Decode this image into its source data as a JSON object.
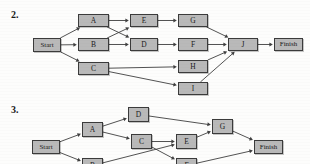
{
  "page": {
    "background_color": "#fdfdfc",
    "width": 310,
    "height": 164
  },
  "problems": [
    {
      "number_label": "2.",
      "number_pos": {
        "x": 11,
        "y": 9
      }
    },
    {
      "number_label": "3.",
      "number_pos": {
        "x": 11,
        "y": 104
      }
    }
  ],
  "style": {
    "node_fill": "#b9b9b9",
    "node_border": "#3b3b3b",
    "edge_color": "#3f3f3f",
    "text_color": "#1b1b1b"
  },
  "diagram_2": {
    "title_label": "2.",
    "nodes": [
      {
        "id": "start",
        "label": "Start",
        "x": 33,
        "y": 38,
        "w": 28,
        "h": 14,
        "terminal": true
      },
      {
        "id": "a",
        "label": "A",
        "x": 78,
        "y": 14,
        "w": 31,
        "h": 13,
        "terminal": false
      },
      {
        "id": "b",
        "label": "B",
        "x": 78,
        "y": 38,
        "w": 31,
        "h": 13,
        "terminal": false
      },
      {
        "id": "c",
        "label": "C",
        "x": 78,
        "y": 62,
        "w": 31,
        "h": 13,
        "terminal": false
      },
      {
        "id": "e",
        "label": "E",
        "x": 130,
        "y": 14,
        "w": 28,
        "h": 13,
        "terminal": false
      },
      {
        "id": "d",
        "label": "D",
        "x": 130,
        "y": 38,
        "w": 28,
        "h": 13,
        "terminal": false
      },
      {
        "id": "g",
        "label": "G",
        "x": 178,
        "y": 14,
        "w": 30,
        "h": 13,
        "terminal": false
      },
      {
        "id": "f",
        "label": "F",
        "x": 178,
        "y": 38,
        "w": 30,
        "h": 13,
        "terminal": false
      },
      {
        "id": "h",
        "label": "H",
        "x": 178,
        "y": 60,
        "w": 30,
        "h": 13,
        "terminal": false
      },
      {
        "id": "i",
        "label": "I",
        "x": 178,
        "y": 82,
        "w": 30,
        "h": 13,
        "terminal": false
      },
      {
        "id": "j",
        "label": "J",
        "x": 228,
        "y": 38,
        "w": 30,
        "h": 13,
        "terminal": false
      },
      {
        "id": "finish",
        "label": "Finish",
        "x": 274,
        "y": 38,
        "w": 29,
        "h": 13,
        "terminal": true
      }
    ],
    "edges": [
      {
        "from": "start",
        "to": "a"
      },
      {
        "from": "start",
        "to": "b"
      },
      {
        "from": "start",
        "to": "c"
      },
      {
        "from": "a",
        "to": "e"
      },
      {
        "from": "a",
        "to": "d"
      },
      {
        "from": "b",
        "to": "e"
      },
      {
        "from": "b",
        "to": "d"
      },
      {
        "from": "e",
        "to": "g"
      },
      {
        "from": "d",
        "to": "f"
      },
      {
        "from": "c",
        "to": "h"
      },
      {
        "from": "c",
        "to": "i"
      },
      {
        "from": "g",
        "to": "j"
      },
      {
        "from": "f",
        "to": "j"
      },
      {
        "from": "h",
        "to": "j"
      },
      {
        "from": "i",
        "to": "j"
      },
      {
        "from": "j",
        "to": "finish"
      }
    ]
  },
  "diagram_3": {
    "title_label": "3.",
    "clipped": true,
    "nodes": [
      {
        "id": "start3",
        "label": "Start",
        "x": 32,
        "y": 140,
        "w": 28,
        "h": 14,
        "terminal": true
      },
      {
        "id": "a3",
        "label": "A",
        "x": 82,
        "y": 122,
        "w": 21,
        "h": 15,
        "terminal": false
      },
      {
        "id": "d3",
        "label": "D",
        "x": 128,
        "y": 107,
        "w": 21,
        "h": 15,
        "terminal": false
      },
      {
        "id": "c3",
        "label": "C",
        "x": 131,
        "y": 134,
        "w": 21,
        "h": 15,
        "terminal": false
      },
      {
        "id": "e3",
        "label": "E",
        "x": 176,
        "y": 134,
        "w": 21,
        "h": 15,
        "terminal": false
      },
      {
        "id": "g3",
        "label": "G",
        "x": 212,
        "y": 119,
        "w": 21,
        "h": 15,
        "terminal": false
      },
      {
        "id": "finish3",
        "label": "Finish",
        "x": 254,
        "y": 140,
        "w": 29,
        "h": 14,
        "terminal": true
      },
      {
        "id": "b3",
        "label": "B",
        "x": 82,
        "y": 158,
        "w": 21,
        "h": 15,
        "terminal": false
      },
      {
        "id": "f3",
        "label": "F",
        "x": 176,
        "y": 158,
        "w": 21,
        "h": 15,
        "terminal": false
      }
    ],
    "edges": [
      {
        "from": "start3",
        "to": "a3"
      },
      {
        "from": "start3",
        "to": "b3"
      },
      {
        "from": "a3",
        "to": "d3"
      },
      {
        "from": "a3",
        "to": "c3"
      },
      {
        "from": "d3",
        "to": "g3"
      },
      {
        "from": "c3",
        "to": "e3"
      },
      {
        "from": "c3",
        "to": "f3"
      },
      {
        "from": "b3",
        "to": "e3"
      },
      {
        "from": "e3",
        "to": "g3"
      },
      {
        "from": "g3",
        "to": "finish3"
      },
      {
        "from": "f3",
        "to": "finish3"
      }
    ]
  }
}
